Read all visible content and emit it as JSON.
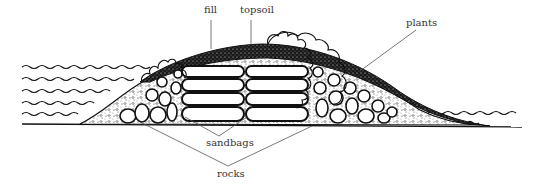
{
  "diagram": {
    "colors": {
      "ink": "#111111",
      "leader": "#555555",
      "label": "#333333",
      "background": "#ffffff"
    },
    "labels": [
      {
        "id": "fill",
        "text": "fill",
        "x": 206,
        "y": 10
      },
      {
        "id": "topsoil",
        "text": "topsoil",
        "x": 241,
        "y": 10
      },
      {
        "id": "plants",
        "text": "plants",
        "x": 405,
        "y": 20
      },
      {
        "id": "sandbags",
        "text": "sandbags",
        "x": 207,
        "y": 141
      },
      {
        "id": "rocks",
        "text": "rocks",
        "x": 218,
        "y": 171
      }
    ],
    "layers": [
      "plants",
      "topsoil",
      "fill",
      "sandbags",
      "rocks",
      "water",
      "ground"
    ]
  }
}
